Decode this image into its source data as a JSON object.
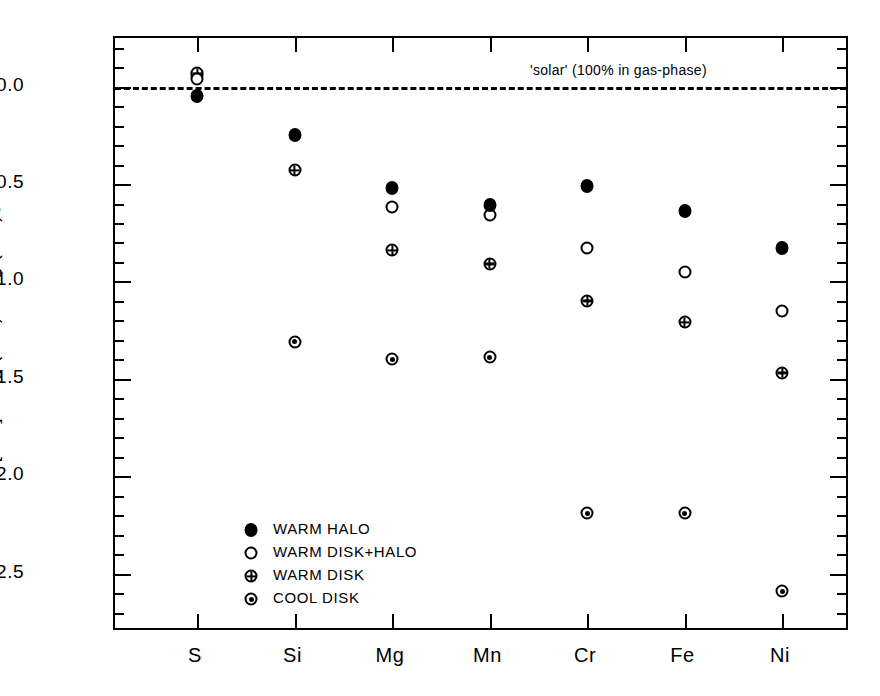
{
  "chart_data": {
    "type": "scatter",
    "title": "",
    "xlabel": "",
    "ylabel": "[X/H] = log (X/H) − log (X/H)",
    "ylabel_sub": "⊙",
    "categories": [
      "S",
      "Si",
      "Mg",
      "Mn",
      "Cr",
      "Fe",
      "Ni"
    ],
    "ylim": [
      -2.8,
      0.25
    ],
    "y_major_ticks": [
      0.0,
      -0.5,
      -1.0,
      -1.5,
      -2.0,
      -2.5
    ],
    "y_major_tick_labels": [
      "0.0",
      "-0.5",
      "-1.0",
      "-1.5",
      "-2.0",
      "-2.5"
    ],
    "y_minor_tick_step": 0.1,
    "grid": false,
    "legend_position": "lower-left-inside",
    "series": [
      {
        "name": "WARM HALO",
        "marker": "filled-circle",
        "categories": [
          "S",
          "Si",
          "Mg",
          "Mn",
          "Cr",
          "Fe",
          "Ni"
        ],
        "values": [
          -0.05,
          -0.25,
          -0.52,
          -0.61,
          -0.51,
          -0.64,
          -0.83
        ]
      },
      {
        "name": "WARM DISK+HALO",
        "marker": "open-circle",
        "categories": [
          "S",
          "Si",
          "Mg",
          "Mn",
          "Cr",
          "Fe",
          "Ni"
        ],
        "values": [
          0.04,
          null,
          -0.62,
          -0.66,
          -0.83,
          -0.95,
          -1.15
        ]
      },
      {
        "name": "WARM DISK",
        "marker": "crossed-circle",
        "categories": [
          "S",
          "Si",
          "Mg",
          "Mn",
          "Cr",
          "Fe",
          "Ni"
        ],
        "values": [
          0.07,
          -0.43,
          -0.84,
          -0.91,
          -1.1,
          -1.21,
          -1.47
        ]
      },
      {
        "name": "COOL DISK",
        "marker": "dotted-circle",
        "categories": [
          "S",
          "Si",
          "Mg",
          "Mn",
          "Cr",
          "Fe",
          "Ni"
        ],
        "values": [
          0.06,
          -1.31,
          -1.4,
          -1.39,
          -2.19,
          -2.19,
          -2.59
        ]
      }
    ],
    "reference_line": {
      "value": 0.0,
      "style": "dashed",
      "label": "'solar' (100% in gas-phase)"
    }
  },
  "legend": {
    "items": [
      {
        "label": "WARM HALO",
        "marker": "filled-circle"
      },
      {
        "label": "WARM DISK+HALO",
        "marker": "open-circle"
      },
      {
        "label": "WARM DISK",
        "marker": "crossed-circle"
      },
      {
        "label": "COOL DISK",
        "marker": "dotted-circle"
      }
    ]
  }
}
